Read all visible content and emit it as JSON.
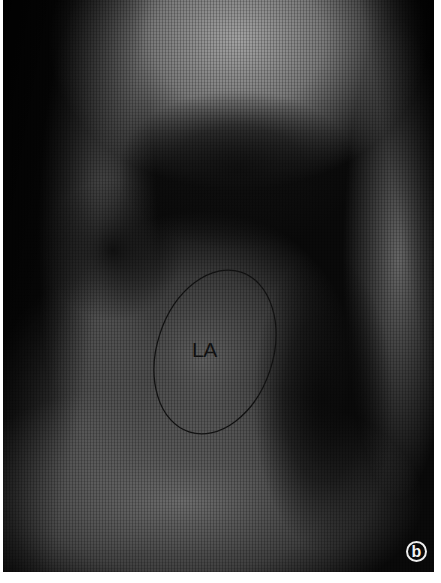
{
  "figure": {
    "type": "lateral chest radiograph",
    "annotation": {
      "shape": "ellipse",
      "label": "LA",
      "stroke_color": "#111111"
    },
    "panel_label": "b",
    "colors": {
      "background": "#0a0a0a",
      "page": "#ffffff",
      "badge": "#eeeeee"
    }
  }
}
